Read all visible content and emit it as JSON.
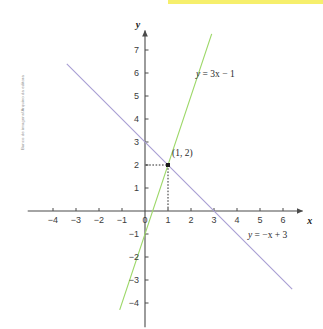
{
  "credit": {
    "text": "Banco de imagens/Arquivo da editora"
  },
  "highlight": {
    "color": "#f5ec52",
    "x": 168,
    "y": 0,
    "width": 155,
    "height": 4
  },
  "axes": {
    "x_name": "x",
    "y_name": "y",
    "origin_label": "0"
  },
  "chart_data": {
    "type": "line",
    "title": "",
    "xlabel": "x",
    "ylabel": "y",
    "grid": false,
    "legend": "inline-annotations",
    "xlim": [
      -5,
      7
    ],
    "ylim": [
      -5,
      8
    ],
    "x_ticks": [
      -4,
      -3,
      -2,
      -1,
      0,
      1,
      2,
      3,
      4,
      5,
      6
    ],
    "x_tick_labels": [
      "−4",
      "−3",
      "−2",
      "−1",
      "0",
      "1",
      "2",
      "3",
      "4",
      "5",
      "6"
    ],
    "y_ticks": [
      -4,
      -3,
      -2,
      -1,
      1,
      2,
      3,
      4,
      5,
      6,
      7
    ],
    "y_tick_labels": [
      "−4",
      "−3",
      "−2",
      "−1",
      "1",
      "2",
      "3",
      "4",
      "5",
      "6",
      "7"
    ],
    "series": [
      {
        "name": "y = 3x − 1",
        "label_lhs": "y",
        "label_rhs": " = 3x − 1",
        "color": "#9ed86a",
        "slope": 3,
        "intercept": -1,
        "x_start": -1.1,
        "x_end": 2.9,
        "label_x": 196,
        "label_y": 77
      },
      {
        "name": "y = −x + 3",
        "label_lhs": "y",
        "label_rhs": " = −x + 3",
        "color": "#a99fd4",
        "slope": -1,
        "intercept": 3,
        "x_start": -3.4,
        "x_end": 6.4,
        "label_x": 248,
        "label_y": 238
      }
    ],
    "annotations": [
      {
        "type": "point",
        "label": "(1, 2)",
        "x": 1,
        "y": 2,
        "leader_to_x_axis": true,
        "leader_to_y_axis": true,
        "label_px_x": 172,
        "label_px_y": 156
      }
    ]
  }
}
